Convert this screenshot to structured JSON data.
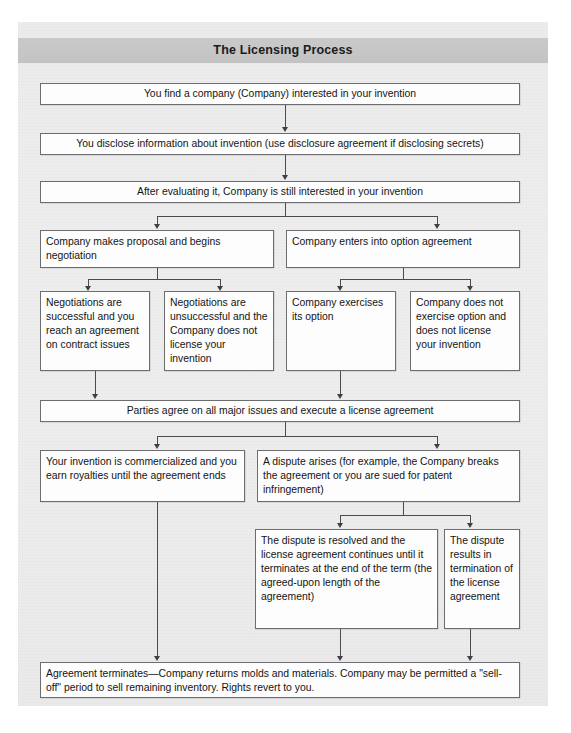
{
  "figure": {
    "title": "The Licensing Process",
    "type": "flowchart"
  },
  "nodes": {
    "n1": {
      "id": "find-company",
      "text": "You find a company (Company) interested in your invention"
    },
    "n2": {
      "id": "disclose-information",
      "text": "You disclose information about invention (use disclosure agreement if disclosing secrets)"
    },
    "n3": {
      "id": "still-interested",
      "text": "After evaluating it, Company is still interested in your invention"
    },
    "n4": {
      "id": "proposal-negotiation",
      "text": "Company makes proposal and begins negotiation"
    },
    "n5": {
      "id": "option-agreement",
      "text": "Company enters into option agreement"
    },
    "n6": {
      "id": "negotiations-successful",
      "text": "Negotiations are successful and you reach an agreement on contract issues"
    },
    "n7": {
      "id": "negotiations-unsuccessful",
      "text": "Negotiations are unsuccessful and the Company does not license your invention"
    },
    "n8": {
      "id": "exercises-option",
      "text": "Company exercises its option"
    },
    "n9": {
      "id": "does-not-exercise-option",
      "text": "Company does not exercise option and does not license your invention"
    },
    "n10": {
      "id": "execute-license",
      "text": "Parties agree on all major issues and execute a license agreement"
    },
    "n11": {
      "id": "commercialized-royalties",
      "text": "Your invention is commercialized and you earn royalties until the agreement ends"
    },
    "n12": {
      "id": "dispute-arises",
      "text": "A dispute arises (for example, the Company breaks the agreement or you are sued for patent infringement)"
    },
    "n13": {
      "id": "dispute-resolved",
      "text": "The dispute is resolved and the license agreement continues until it terminates at the end of the term (the agreed-upon length of the agreement)"
    },
    "n14": {
      "id": "dispute-termination",
      "text": "The dispute results in termination of the license agreement"
    },
    "n15": {
      "id": "agreement-terminates",
      "text": "Agreement terminates—Company returns molds and materials. Company may be permitted a \"sell-off\" period to sell remaining inventory. Rights revert to you."
    }
  },
  "edges": [
    {
      "from": "find-company",
      "to": "disclose-information"
    },
    {
      "from": "disclose-information",
      "to": "still-interested"
    },
    {
      "from": "still-interested",
      "to": "proposal-negotiation"
    },
    {
      "from": "still-interested",
      "to": "option-agreement"
    },
    {
      "from": "proposal-negotiation",
      "to": "negotiations-successful"
    },
    {
      "from": "proposal-negotiation",
      "to": "negotiations-unsuccessful"
    },
    {
      "from": "option-agreement",
      "to": "exercises-option"
    },
    {
      "from": "option-agreement",
      "to": "does-not-exercise-option"
    },
    {
      "from": "negotiations-successful",
      "to": "execute-license"
    },
    {
      "from": "exercises-option",
      "to": "execute-license"
    },
    {
      "from": "execute-license",
      "to": "commercialized-royalties"
    },
    {
      "from": "execute-license",
      "to": "dispute-arises"
    },
    {
      "from": "dispute-arises",
      "to": "dispute-resolved"
    },
    {
      "from": "dispute-arises",
      "to": "dispute-termination"
    },
    {
      "from": "commercialized-royalties",
      "to": "agreement-terminates"
    },
    {
      "from": "dispute-resolved",
      "to": "agreement-terminates"
    },
    {
      "from": "dispute-termination",
      "to": "agreement-terminates"
    }
  ],
  "colors": {
    "page_background": "#ededee",
    "title_band": "#c6c6c7",
    "box_fill": "#fdfdfd",
    "box_border": "#6d6d70",
    "connector": "#4b4b50",
    "text": "#141414"
  }
}
